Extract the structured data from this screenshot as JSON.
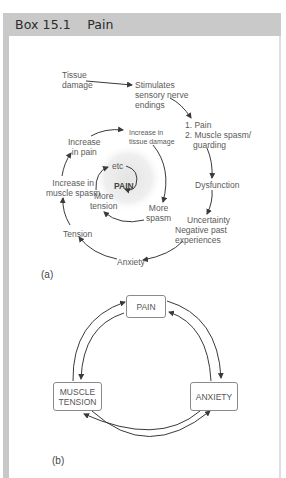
{
  "box": {
    "title": "Box 15.1    Pain",
    "number": "Box 15.1",
    "subject": "Pain",
    "colors": {
      "header_bg": "#c9c9c9",
      "frame": "#c8c8c8",
      "line": "#555555"
    }
  },
  "diagram_a": {
    "label": "(a)",
    "nodes": {
      "tissue_damage": [
        "Tissue",
        "damage"
      ],
      "stimulates": [
        "Stimulates",
        "sensory nerve",
        "endings"
      ],
      "pain_spasm": [
        "1. Pain",
        "2. Muscle spasm/",
        "guarding"
      ],
      "dysfunction": "Dysfunction",
      "uncertainty": [
        "Uncertainty",
        "Negative past",
        "experiences"
      ],
      "anxiety": "Anxiety",
      "tension": "Tension",
      "increase_spasm": [
        "Increase in",
        "muscle spasm"
      ],
      "increase_pain": [
        "Increase",
        "in pain"
      ],
      "increase_tissue": [
        "Increase in",
        "tissue damage"
      ],
      "more_spasm": [
        "More",
        "spasm"
      ],
      "more_tension": [
        "More",
        "tension"
      ],
      "etc": "etc",
      "center_pain": "PAIN"
    }
  },
  "diagram_b": {
    "label": "(b)",
    "nodes": {
      "pain": "PAIN",
      "muscle_tension": [
        "MUSCLE",
        "TENSION"
      ],
      "anxiety": "ANXIETY"
    }
  }
}
